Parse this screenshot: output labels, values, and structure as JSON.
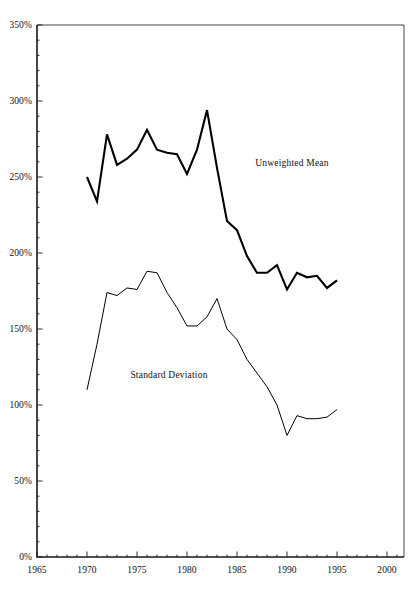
{
  "chart_data": {
    "type": "line",
    "title": "",
    "subtitle": "",
    "xlabel": "",
    "ylabel": "",
    "xlim": [
      1965,
      2000
    ],
    "ylim": [
      0,
      350
    ],
    "grid": false,
    "legend_position": "inline-annotations",
    "x_ticks_major": [
      1965,
      1970,
      1975,
      1980,
      1985,
      1990,
      1995,
      2000
    ],
    "x_tick_labels": [
      "1965",
      "1970",
      "1975",
      "1980",
      "1985",
      "1990",
      "1995",
      "2000"
    ],
    "x_minor_tick_step": 1,
    "y_ticks_major": [
      0,
      50,
      100,
      150,
      200,
      250,
      300,
      350
    ],
    "y_tick_labels": [
      "0%",
      "50%",
      "100%",
      "150%",
      "200%",
      "250%",
      "300%",
      "350%"
    ],
    "y_minor_tick_step": 10,
    "value_suffix": "%",
    "series": [
      {
        "name": "Unweighted Mean",
        "label_x": 1990.5,
        "label_y": 257,
        "stroke_width": 2.1,
        "color": "#000000",
        "x": [
          1970,
          1971,
          1972,
          1973,
          1974,
          1975,
          1976,
          1977,
          1978,
          1979,
          1980,
          1981,
          1982,
          1983,
          1984,
          1985,
          1986,
          1987,
          1988,
          1989,
          1990,
          1991,
          1992,
          1993,
          1994,
          1995
        ],
        "values": [
          250,
          234,
          278,
          258,
          262,
          268,
          281,
          268,
          266,
          265,
          252,
          268,
          294,
          256,
          221,
          215,
          198,
          187,
          187,
          192,
          176,
          187,
          184,
          185,
          177,
          182
        ]
      },
      {
        "name": "Standard Deviation",
        "label_x": 1978.2,
        "label_y": 118,
        "stroke_width": 1.0,
        "color": "#000000",
        "x": [
          1970,
          1971,
          1972,
          1973,
          1974,
          1975,
          1976,
          1977,
          1978,
          1979,
          1980,
          1981,
          1982,
          1983,
          1984,
          1985,
          1986,
          1987,
          1988,
          1989,
          1990,
          1991,
          1992,
          1993,
          1994,
          1995
        ],
        "values": [
          110,
          140,
          174,
          172,
          177,
          176,
          188,
          187,
          174,
          164,
          152,
          152,
          158,
          170,
          150,
          143,
          130,
          121,
          112,
          100,
          80,
          93,
          91,
          91,
          92,
          97
        ]
      }
    ]
  },
  "annotations": {
    "unweighted_mean_label": "Unweighted Mean",
    "standard_deviation_label": "Standard Deviation"
  }
}
